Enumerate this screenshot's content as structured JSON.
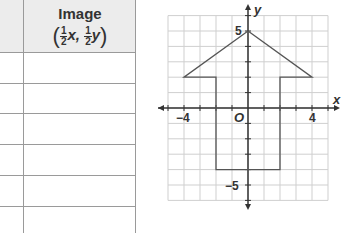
{
  "table": {
    "header": {
      "title": "Image",
      "formula": {
        "open_paren": "(",
        "coef_x_num": "1",
        "coef_x_den": "2",
        "var_x": "x,",
        "coef_y_num": "1",
        "coef_y_den": "2",
        "var_y": "y",
        "close_paren": ")"
      }
    },
    "rows": [
      "",
      "",
      "",
      "",
      "",
      ""
    ]
  },
  "graph": {
    "x_axis_label": "x",
    "y_axis_label": "y",
    "origin_label": "O",
    "tick_labels": {
      "x_neg4": "−4",
      "x_pos4": "4",
      "y_pos5": "5",
      "y_neg5": "−5"
    },
    "shape_vertices": [
      [
        0,
        5
      ],
      [
        4,
        2
      ],
      [
        2,
        2
      ],
      [
        2,
        -4
      ],
      [
        -2,
        -4
      ],
      [
        -2,
        2
      ],
      [
        -4,
        2
      ]
    ],
    "grid_range": {
      "x": [
        -5,
        5
      ],
      "y": [
        -6,
        6
      ]
    },
    "colors": {
      "grid": "#cfcfcf",
      "axis": "#333333",
      "shape": "#555555"
    }
  }
}
